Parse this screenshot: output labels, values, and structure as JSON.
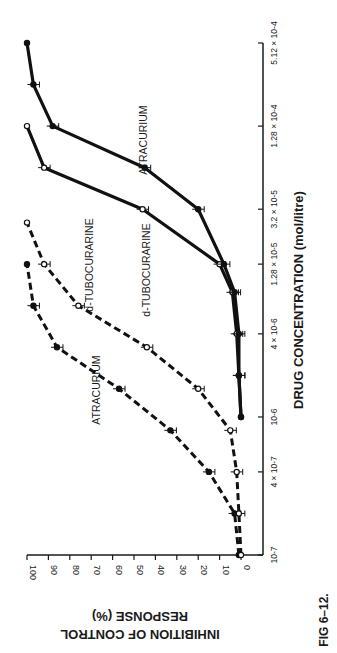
{
  "figure": {
    "caption": "FIG 6–12."
  },
  "chart_data": {
    "type": "line",
    "orientation": "rotated-90-clockwise",
    "title": "",
    "xlabel": "DRUG CONCENTRATION  (mol/litre)",
    "ylabel_line1": "INHIBITION OF CONTROL",
    "ylabel_line2": "RESPONSE (%)",
    "xscale": "log",
    "x_ticks": [
      1e-07,
      4e-07,
      1e-06,
      4e-06,
      1.28e-05,
      3.2e-05,
      0.000128,
      0.000512
    ],
    "x_tick_labels": [
      "10-7",
      "4 × 10-7",
      "10-6",
      "4 × 10-6",
      "1.28 × 10-5",
      "3.2 × 10-5",
      "1.28 × 10-4",
      "5.12 × 10-4"
    ],
    "y_ticks": [
      0,
      10,
      20,
      30,
      40,
      50,
      60,
      70,
      80,
      90,
      100
    ],
    "ylim": [
      0,
      100
    ],
    "grid": false,
    "legend": "inline labels",
    "series": [
      {
        "name": "ATRACURIUM",
        "group": "dashed",
        "marker": "filled",
        "x": [
          1e-07,
          2e-07,
          4e-07,
          8e-07,
          1.6e-06,
          3.2e-06,
          6.4e-06,
          1.28e-05
        ],
        "y": [
          1,
          3,
          15,
          33,
          57,
          86,
          97,
          100
        ]
      },
      {
        "name": "d-TUBOCURARINE",
        "group": "dashed",
        "marker": "open",
        "x": [
          1e-07,
          2e-07,
          4e-07,
          8e-07,
          1.6e-06,
          3.2e-06,
          6.4e-06,
          1.28e-05,
          2.56e-05
        ],
        "y": [
          0,
          1,
          2,
          5,
          20,
          44,
          76,
          92,
          100
        ]
      },
      {
        "name": "d-TUBOCURARINE",
        "group": "solid",
        "marker": "open",
        "x": [
          1e-06,
          2e-06,
          4e-06,
          8e-06,
          1.28e-05,
          3.2e-05,
          6.4e-05,
          0.000128
        ],
        "y": [
          0,
          1,
          2,
          4,
          10,
          46,
          92,
          100
        ]
      },
      {
        "name": "ATRACURIUM",
        "group": "solid",
        "marker": "filled",
        "x": [
          1e-06,
          2e-06,
          4e-06,
          8e-06,
          1.28e-05,
          3.2e-05,
          6.4e-05,
          0.000128,
          0.000256,
          0.000512
        ],
        "y": [
          0,
          1,
          1,
          3,
          8,
          20,
          45,
          88,
          97,
          100
        ]
      }
    ],
    "series_labels": [
      {
        "text": "ATRACURIUM",
        "for": "dashed-atracurium"
      },
      {
        "text": "d-TUBOCURARINE",
        "for": "dashed-tubocurarine"
      },
      {
        "text": "d-TUBOCURARINE",
        "for": "solid-tubocurarine"
      },
      {
        "text": "ATRACURIUM",
        "for": "solid-atracurium"
      }
    ]
  }
}
